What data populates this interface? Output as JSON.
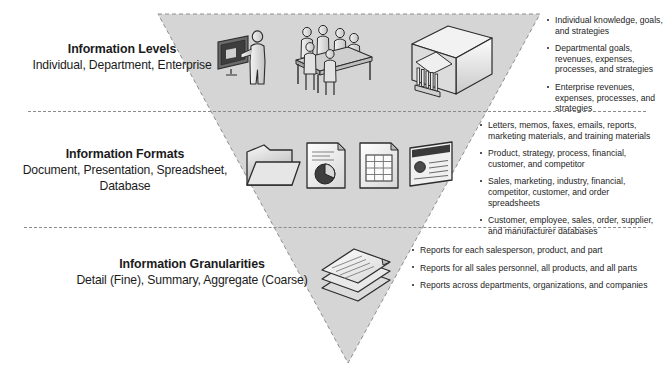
{
  "diagram": {
    "shape": "inverted-triangle",
    "fill_color": "#d4d4d4",
    "edge_color": "#8b8b8b",
    "text_color": "#1d1d1d",
    "tiers": [
      {
        "id": "levels",
        "title": "Information Levels",
        "subtitle": "Individual, Department, Enterprise",
        "icons": [
          "individual-person-at-monitor-icon",
          "department-meeting-table-icon",
          "enterprise-building-cube-icon"
        ],
        "bullets": [
          "Individual knowledge, goals, and strategies",
          "Departmental goals, revenues, expenses, processes, and strategies",
          "Enterprise revenues, expenses, processes, and strategies"
        ]
      },
      {
        "id": "formats",
        "title": "Information Formats",
        "subtitle": "Document, Presentation, Spreadsheet, Database",
        "icons": [
          "document-folder-icon",
          "presentation-piechart-page-icon",
          "spreadsheet-grid-page-icon",
          "database-card-icon"
        ],
        "bullets": [
          "Letters, memos, faxes, emails, reports, marketing materials, and training materials",
          "Product, strategy, process, financial, customer, and competitor",
          "Sales, marketing, industry, financial, competitor, customer, and order spreadsheets",
          "Customer, employee, sales, order, supplier, and manufacturer databases"
        ]
      },
      {
        "id": "granularities",
        "title": "Information Granularities",
        "subtitle": "Detail (Fine), Summary, Aggregate (Coarse)",
        "icons": [
          "stacked-reports-icon"
        ],
        "bullets": [
          "Reports for each salesperson, product, and part",
          "Reports for all sales personnel, all products, and all parts",
          "Reports across departments, organizations, and companies"
        ]
      }
    ]
  }
}
